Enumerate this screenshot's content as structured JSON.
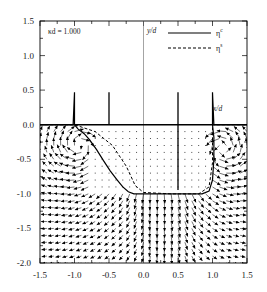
{
  "chart_data": {
    "type": "scatter",
    "title": "",
    "subtitle": "",
    "annotation": "κd = 1.000",
    "xlabel": "x/d",
    "ylabel": "y/d",
    "xlim": [
      -1.5,
      1.5
    ],
    "ylim": [
      -2.0,
      1.5
    ],
    "grid": false,
    "xticks": [
      -1.5,
      -1.0,
      -0.5,
      0.0,
      0.5,
      1.0,
      1.5
    ],
    "xticklabels": [
      "-1.5",
      "-1.0",
      "-0.5",
      "0.0",
      "0.5",
      "1.0",
      "1.5"
    ],
    "yticks": [
      1.5,
      1.0,
      0.5,
      0.0,
      -0.5,
      -1.0,
      -1.5,
      -2.0
    ],
    "yticklabels": [
      "1.5",
      "1.0",
      "0.5",
      "0.0",
      "-0.5",
      "-1.0",
      "-1.5",
      "-2.0"
    ],
    "legend_position": "top-right",
    "legend": [
      {
        "label": "η",
        "superscript": "c",
        "style": "solid"
      },
      {
        "label": "η",
        "superscript": "s",
        "style": "dashed"
      }
    ],
    "series": [
      {
        "name": "eta_c",
        "style": "solid",
        "description": "free-surface / contour curve with vertical spikes at x = -1.0 and x = 1.0 rising to y = 0.47, plus a flat segment at y = -1.0 between x = -0.2 and x = 0.95",
        "points": [
          [
            -1.5,
            0.0
          ],
          [
            -1.2,
            0.0
          ],
          [
            -1.02,
            0.0
          ],
          [
            -1.0,
            0.47
          ],
          [
            -1.0,
            0.0
          ],
          [
            -0.95,
            -0.06
          ],
          [
            -0.86,
            -0.13
          ],
          [
            -0.78,
            -0.22
          ],
          [
            -0.68,
            -0.36
          ],
          [
            -0.58,
            -0.52
          ],
          [
            -0.48,
            -0.67
          ],
          [
            -0.38,
            -0.8
          ],
          [
            -0.3,
            -0.9
          ],
          [
            -0.22,
            -0.97
          ],
          [
            -0.14,
            -1.0
          ],
          [
            0.0,
            -1.0
          ],
          [
            0.3,
            -1.0
          ],
          [
            0.6,
            -1.0
          ],
          [
            0.85,
            -1.0
          ],
          [
            0.95,
            -0.96
          ],
          [
            1.0,
            -0.8
          ],
          [
            1.02,
            -0.5
          ],
          [
            1.02,
            -0.18
          ],
          [
            1.0,
            0.0
          ],
          [
            1.0,
            0.47
          ],
          [
            1.02,
            0.0
          ],
          [
            1.2,
            0.0
          ],
          [
            1.5,
            0.0
          ]
        ]
      },
      {
        "name": "eta_s",
        "style": "dashed",
        "description": "second surface-elevation curve overlapping the zero line and inner vortex cores",
        "points": [
          [
            -1.5,
            0.0
          ],
          [
            -1.0,
            0.0
          ],
          [
            -0.7,
            -0.1
          ],
          [
            -0.45,
            -0.3
          ],
          [
            -0.25,
            -0.6
          ],
          [
            -0.12,
            -0.88
          ],
          [
            0.0,
            -0.98
          ],
          [
            0.4,
            -1.0
          ],
          [
            0.8,
            -1.0
          ],
          [
            0.95,
            -0.9
          ],
          [
            1.0,
            -0.55
          ],
          [
            1.0,
            -0.1
          ],
          [
            1.0,
            0.0
          ],
          [
            1.5,
            0.0
          ]
        ]
      }
    ],
    "vector_field": {
      "description": "velocity arrows on a grid covering -1.5 <= x <= 1.5, -2.0 <= y <= 0.0; tiny dots inside the interior region between the two spikes above y = -1.0; long arrows forming counter-rotating vortices centred near (-0.85,-0.35) and (1.1,-0.35) and a downward jet near x = 0.3",
      "x_range": [
        -1.5,
        1.5
      ],
      "y_range": [
        -2.0,
        0.0
      ],
      "nx": 31,
      "ny": 21,
      "vortex_centers": [
        [
          -0.9,
          -0.3
        ],
        [
          1.12,
          -0.35
        ]
      ],
      "jet_center_x": 0.35
    }
  },
  "axes": {
    "frame_color": "#000000",
    "line_color": "#000000"
  }
}
